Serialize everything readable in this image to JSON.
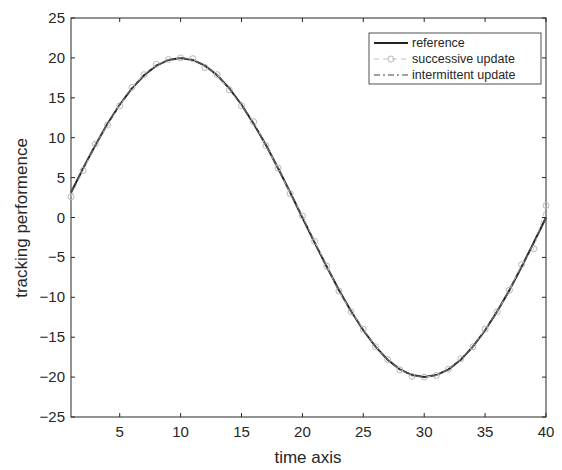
{
  "chart_data": {
    "type": "line",
    "title": "",
    "xlabel": "time axis",
    "ylabel": "tracking performence",
    "xlim": [
      1,
      40
    ],
    "ylim": [
      -25,
      25
    ],
    "xticks": [
      5,
      10,
      15,
      20,
      25,
      30,
      35,
      40
    ],
    "yticks": [
      -25,
      -20,
      -15,
      -10,
      -5,
      0,
      5,
      10,
      15,
      20,
      25
    ],
    "grid": false,
    "legend_position": "upper right",
    "x": [
      1,
      2,
      3,
      4,
      5,
      6,
      7,
      8,
      9,
      10,
      11,
      12,
      13,
      14,
      15,
      16,
      17,
      18,
      19,
      20,
      21,
      22,
      23,
      24,
      25,
      26,
      27,
      28,
      29,
      30,
      31,
      32,
      33,
      34,
      35,
      36,
      37,
      38,
      39,
      40
    ],
    "series": [
      {
        "name": "reference",
        "style": "solid",
        "color": "#222222",
        "values": [
          3.13,
          6.18,
          9.08,
          11.76,
          14.14,
          16.18,
          17.82,
          19.02,
          19.75,
          20.0,
          19.75,
          19.02,
          17.82,
          16.18,
          14.14,
          11.76,
          9.08,
          6.18,
          3.13,
          0.0,
          -3.13,
          -6.18,
          -9.08,
          -11.76,
          -14.14,
          -16.18,
          -17.82,
          -19.02,
          -19.75,
          -20.0,
          -19.75,
          -19.02,
          -17.82,
          -16.18,
          -14.14,
          -11.76,
          -9.08,
          -6.18,
          -3.13,
          0.0
        ]
      },
      {
        "name": "successive update",
        "style": "dashed-circle-marker",
        "color": "#b0b0b0",
        "values": [
          2.6,
          5.9,
          9.2,
          11.6,
          14.0,
          16.3,
          17.9,
          19.2,
          19.8,
          20.0,
          19.9,
          18.8,
          17.9,
          16.0,
          14.0,
          12.0,
          9.0,
          6.2,
          3.0,
          0.2,
          -3.0,
          -6.1,
          -9.2,
          -11.8,
          -14.0,
          -16.2,
          -17.8,
          -19.1,
          -19.9,
          -20.0,
          -19.8,
          -19.0,
          -17.7,
          -16.2,
          -14.0,
          -11.8,
          -9.1,
          -5.9,
          -3.9,
          1.5
        ]
      },
      {
        "name": "intermittent update",
        "style": "dash-dot",
        "color": "#444444",
        "values": [
          3.13,
          6.18,
          9.08,
          11.76,
          14.14,
          16.18,
          17.82,
          19.02,
          19.75,
          20.0,
          19.75,
          19.02,
          17.82,
          16.18,
          14.14,
          11.76,
          9.08,
          6.18,
          3.13,
          0.0,
          -3.13,
          -6.18,
          -9.08,
          -11.76,
          -14.14,
          -16.18,
          -17.82,
          -19.02,
          -19.75,
          -20.0,
          -19.75,
          -19.02,
          -17.82,
          -16.18,
          -14.14,
          -11.76,
          -9.08,
          -6.18,
          -3.13,
          0.0
        ]
      }
    ]
  },
  "legend": {
    "items": [
      "reference",
      "successive update",
      "intermittent update"
    ]
  },
  "axes": {
    "xlabel": "time axis",
    "ylabel": "tracking performence"
  }
}
